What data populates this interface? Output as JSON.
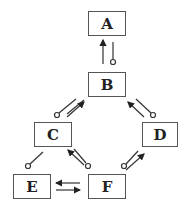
{
  "diagram": {
    "nodes": [
      {
        "id": "A",
        "label": "A",
        "x": 88,
        "y": 11,
        "w": 38,
        "h": 25
      },
      {
        "id": "B",
        "label": "B",
        "x": 88,
        "y": 72,
        "w": 38,
        "h": 25
      },
      {
        "id": "C",
        "label": "C",
        "x": 34,
        "y": 122,
        "w": 38,
        "h": 25
      },
      {
        "id": "D",
        "label": "D",
        "x": 142,
        "y": 122,
        "w": 36,
        "h": 25
      },
      {
        "id": "E",
        "label": "E",
        "x": 13,
        "y": 174,
        "w": 38,
        "h": 25
      },
      {
        "id": "F",
        "label": "F",
        "x": 88,
        "y": 174,
        "w": 38,
        "h": 25
      }
    ],
    "edges": [
      {
        "from": "B",
        "to": "A",
        "arrow": "filled-arrow"
      },
      {
        "from": "A",
        "to": "B",
        "arrow": "open-circle"
      },
      {
        "from": "C",
        "to": "B",
        "arrow": "filled-arrow"
      },
      {
        "from": "B",
        "to": "C",
        "arrow": "open-circle"
      },
      {
        "from": "D",
        "to": "B",
        "arrow": "filled-arrow"
      },
      {
        "from": "B",
        "to": "D",
        "arrow": "open-circle"
      },
      {
        "from": "F",
        "to": "C",
        "arrow": "filled-arrow"
      },
      {
        "from": "C",
        "to": "F",
        "arrow": "open-circle"
      },
      {
        "from": "F",
        "to": "D",
        "arrow": "filled-arrow"
      },
      {
        "from": "D",
        "to": "F",
        "arrow": "open-circle"
      },
      {
        "from": "C",
        "to": "E",
        "arrow": "open-circle"
      },
      {
        "from": "F",
        "to": "E",
        "arrow": "filled-arrow"
      },
      {
        "from": "E",
        "to": "F",
        "arrow": "filled-arrow"
      }
    ],
    "colors": {
      "stroke": "#333333",
      "fill": "#ffffff"
    }
  }
}
